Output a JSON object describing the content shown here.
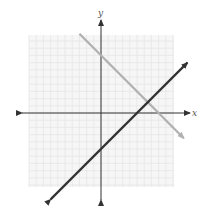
{
  "chart_data": {
    "type": "line",
    "title": "",
    "xlabel": "x",
    "ylabel": "y",
    "xlim": [
      -10,
      10
    ],
    "ylim": [
      -10,
      11
    ],
    "grid": true,
    "tick_labels": false,
    "legend": null,
    "series": [
      {
        "name": "line-1",
        "equation": "y = -x + 8",
        "slope": -1,
        "y_intercept": 8,
        "x_intercept": 8,
        "color": "#b0b0b0",
        "x": [
          -3,
          11.5
        ],
        "y": [
          11,
          -3.5
        ]
      },
      {
        "name": "line-2",
        "equation": "y = x - 5",
        "slope": 1,
        "y_intercept": -5,
        "x_intercept": 5,
        "color": "#333333",
        "x": [
          -7,
          12
        ],
        "y": [
          -12,
          7
        ]
      }
    ],
    "intersection": {
      "x": 6.5,
      "y": 1.5
    }
  },
  "axes": {
    "x_label": "x",
    "y_label": "y"
  },
  "colors": {
    "grid": "#e6e6e6",
    "grid_bg": "#f6f6f6",
    "axis": "#333333"
  }
}
